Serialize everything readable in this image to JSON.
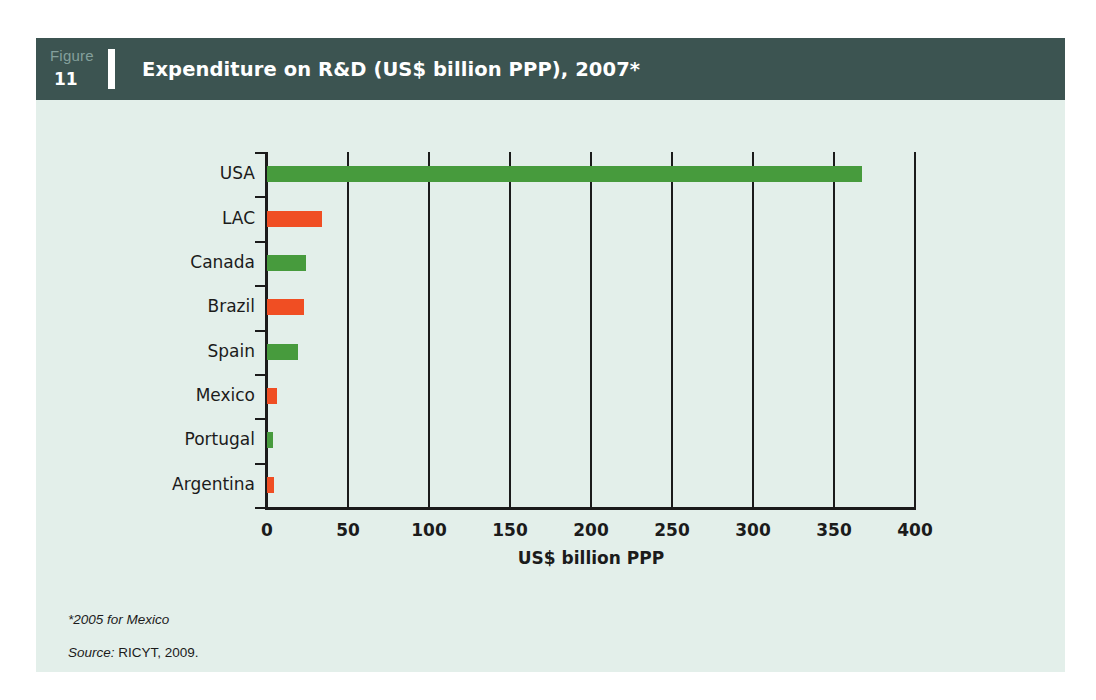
{
  "figure": {
    "label_word": "Figure",
    "number": "11",
    "title": "Expenditure on R&D (US$ billion PPP), 2007*"
  },
  "footnotes": {
    "asterisk_note": "*2005 for Mexico",
    "source_word": "Source:",
    "source_value": "RICYT, 2009."
  },
  "colors": {
    "header_bar": "#3c5451",
    "panel_background": "#e3efea",
    "bar_green": "#479b3d",
    "bar_orange": "#f04e23",
    "axis": "#1b1b1b",
    "figure_word": "#84a09c"
  },
  "chart_data": {
    "type": "bar",
    "orientation": "horizontal",
    "title": "Expenditure on R&D (US$ billion PPP), 2007*",
    "xlabel": "US$ billion PPP",
    "ylabel": "",
    "xlim": [
      0,
      400
    ],
    "xticks": [
      0,
      50,
      100,
      150,
      200,
      250,
      300,
      350,
      400
    ],
    "xtick_labels": [
      "0",
      "50",
      "100",
      "150",
      "200",
      "250",
      "300",
      "350",
      "400"
    ],
    "grid": "vertical",
    "legend": "none",
    "categories": [
      "USA",
      "LAC",
      "Canada",
      "Brazil",
      "Spain",
      "Mexico",
      "Portugal",
      "Argentina"
    ],
    "values": [
      367,
      34,
      24,
      23,
      19,
      6,
      4,
      4.5
    ],
    "bar_colors": [
      "green",
      "orange",
      "green",
      "orange",
      "green",
      "orange",
      "green",
      "orange"
    ],
    "units": "US$ billion PPP"
  }
}
